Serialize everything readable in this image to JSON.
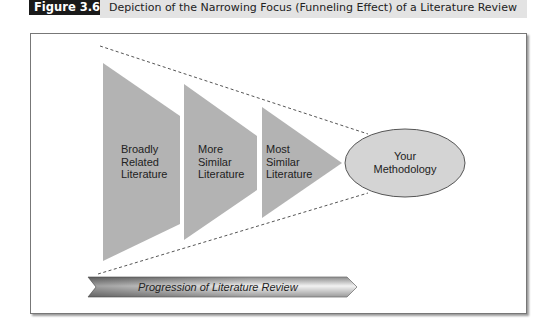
{
  "figure": {
    "label": "Figure 3.6",
    "title": "Depiction of the Narrowing Focus (Funneling Effect) of a Literature Review"
  },
  "diagram": {
    "stages": [
      {
        "lines": [
          "Broadly",
          "Related",
          "Literature"
        ]
      },
      {
        "lines": [
          "More",
          "Similar",
          "Literature"
        ]
      },
      {
        "lines": [
          "Most",
          "Similar",
          "Literature"
        ]
      }
    ],
    "endpoint": {
      "lines": [
        "Your",
        "Methodology"
      ]
    },
    "progression_arrow": {
      "label": "Progression of Literature Review"
    },
    "colors": {
      "shape_fill": "#b3b3b3",
      "ellipse_fill": "#d4d4d4",
      "ellipse_stroke": "#555555",
      "dash_line": "#555555",
      "label_box": "#1a1a1a",
      "title_bar": "#e3e3e3"
    }
  }
}
